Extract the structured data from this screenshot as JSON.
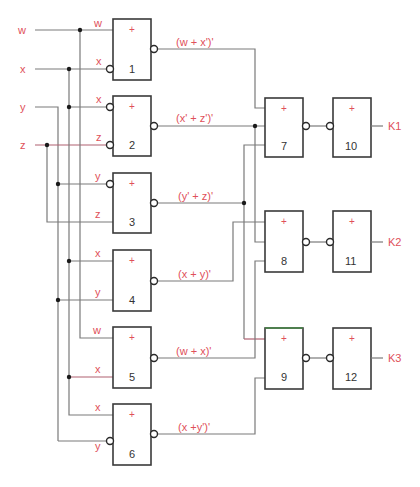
{
  "inputs": {
    "w": "w",
    "x": "x",
    "y": "y",
    "z": "z"
  },
  "gate_symbol": "+",
  "gates": [
    {
      "id": "1",
      "in_a": "w",
      "in_b": "x",
      "output": "(w + x')'"
    },
    {
      "id": "2",
      "in_a": "x",
      "in_b": "z",
      "output": "(x' + z')'"
    },
    {
      "id": "3",
      "in_a": "y",
      "in_b": "z",
      "output": "(y' + z)'"
    },
    {
      "id": "4",
      "in_a": "x",
      "in_b": "y",
      "output": "(x + y)'"
    },
    {
      "id": "5",
      "in_a": "w",
      "in_b": "x",
      "output": "(w + x)'"
    },
    {
      "id": "6",
      "in_a": "x",
      "in_b": "y",
      "output": "(x +y')'"
    },
    {
      "id": "7"
    },
    {
      "id": "8"
    },
    {
      "id": "9"
    },
    {
      "id": "10"
    },
    {
      "id": "11"
    },
    {
      "id": "12"
    }
  ],
  "outputs": {
    "k1": "K1",
    "k2": "K2",
    "k3": "K3"
  },
  "colors": {
    "label_red": "#e0505a",
    "wire_gray": "#7a7a7a",
    "gate_border": "#3a3a3a"
  }
}
